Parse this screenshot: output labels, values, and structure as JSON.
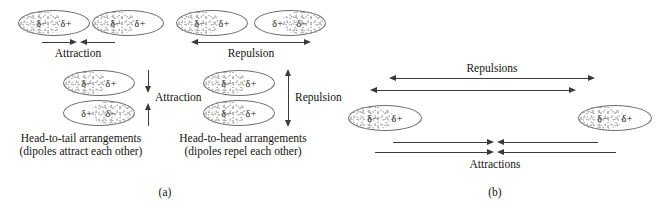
{
  "figure": {
    "charge_negative": "δ−",
    "charge_positive": "δ+"
  },
  "panel_a": {
    "label": "(a)",
    "head_to_tail_horizontal": {
      "left_molecule": {
        "left_charge": "δ−",
        "right_charge": "δ+"
      },
      "right_molecule": {
        "left_charge": "δ−",
        "right_charge": "δ+"
      },
      "arrow_label": "Attraction"
    },
    "head_to_head_horizontal": {
      "left_molecule": {
        "left_charge": "δ−",
        "right_charge": "δ+"
      },
      "right_molecule": {
        "left_charge": "δ+",
        "right_charge": "δ−"
      },
      "arrow_label": "Repulsion"
    },
    "head_to_tail_vertical": {
      "top_molecule": {
        "left_charge": "δ−",
        "right_charge": "δ+"
      },
      "bottom_molecule": {
        "left_charge": "δ+",
        "right_charge": "δ−"
      },
      "arrow_label": "Attraction"
    },
    "head_to_head_vertical": {
      "top_molecule": {
        "left_charge": "δ−",
        "right_charge": "δ+"
      },
      "bottom_molecule": {
        "left_charge": "δ−",
        "right_charge": "δ+"
      },
      "arrow_label": "Repulsion"
    },
    "caption_left_line1": "Head-to-tail arrangements",
    "caption_left_line2": "(dipoles attract each other)",
    "caption_right_line1": "Head-to-head arrangements",
    "caption_right_line2": "(dipoles repel each other)"
  },
  "panel_b": {
    "label": "(b)",
    "left_molecule": {
      "left_charge": "δ−",
      "right_charge": "δ+"
    },
    "right_molecule": {
      "left_charge": "δ−",
      "right_charge": "δ+"
    },
    "repulsions_label": "Repulsions",
    "attractions_label": "Attractions"
  }
}
